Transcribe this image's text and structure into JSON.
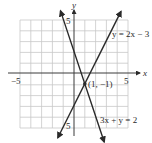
{
  "figure": {
    "type": "coordinate-graph",
    "axes": {
      "x_label": "x",
      "y_label": "y",
      "x_range": [
        -5,
        5
      ],
      "y_range": [
        -5,
        5
      ],
      "tick_labels": {
        "x_neg": "−5",
        "x_pos": "5",
        "y_pos": "5",
        "y_neg": "5"
      },
      "grid": true,
      "grid_step": 1
    },
    "lines": [
      {
        "equation": "y = 2x − 3",
        "slope": 2,
        "intercept": -3,
        "color": "#2a2a2a"
      },
      {
        "equation": "3x + y = 2",
        "slope": -3,
        "intercept": 2,
        "color": "#2a2a2a"
      }
    ],
    "intersection": {
      "label": "(1, −1)",
      "x": 1,
      "y": -1
    },
    "colors": {
      "grid": "#c8c8c8",
      "axis": "#3a3a3a",
      "line": "#2a2a2a",
      "background": "#ffffff"
    }
  }
}
